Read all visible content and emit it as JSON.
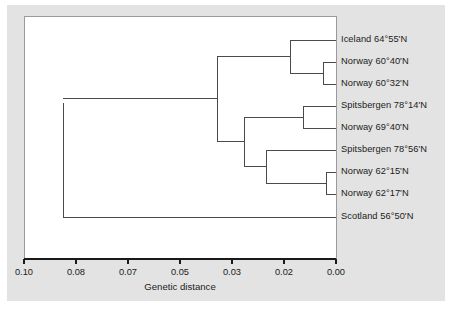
{
  "figure": {
    "background_color": "#ffffff",
    "plate_color": "#e3e3e3",
    "panel_color": "#ffffff",
    "line_color": "#4a4a4a",
    "text_color": "#1b1b1b"
  },
  "chart_data": {
    "type": "dendrogram",
    "title": "",
    "xlabel": "Genetic distance",
    "ylabel": "",
    "xlim": [
      0.1,
      0.0
    ],
    "x_axis_reversed": true,
    "grid": false,
    "legend": "none",
    "tick_labels": [
      "0.10",
      "0.08",
      "0.07",
      "0.05",
      "0.03",
      "0.02",
      "0.00"
    ],
    "tick_values": [
      0.1,
      0.08,
      0.07,
      0.05,
      0.03,
      0.02,
      0.0
    ],
    "tick_positions_px": [
      24,
      76,
      128,
      180,
      232,
      284,
      336
    ],
    "leaves": [
      {
        "label": "Iceland 64°55'N",
        "y_px": 40
      },
      {
        "label": "Norway 60°40'N",
        "y_px": 62
      },
      {
        "label": "Norway 60°32'N",
        "y_px": 84
      },
      {
        "label": "Spitsbergen 78°14'N",
        "y_px": 106
      },
      {
        "label": "Norway 69°40'N",
        "y_px": 128
      },
      {
        "label": "Spitsbergen 78°56'N",
        "y_px": 150
      },
      {
        "label": "Norway 62°15'N",
        "y_px": 172
      },
      {
        "label": "Norway 62°17'N",
        "y_px": 194
      },
      {
        "label": "Scotland 56°50'N",
        "y_px": 217
      }
    ],
    "nodes": [
      {
        "name": "norway-60-pair",
        "x_px": 323,
        "merge_distance": 0.005,
        "y_top_px": 62,
        "y_bot_px": 84
      },
      {
        "name": "iceland-norway60-clade",
        "x_px": 290,
        "merge_distance": 0.019,
        "y_top_px": 40,
        "y_bot_px": 73
      },
      {
        "name": "spitsbergen78-14-norway69-pair",
        "x_px": 303,
        "merge_distance": 0.013,
        "y_top_px": 106,
        "y_bot_px": 128
      },
      {
        "name": "norway-62-pair",
        "x_px": 326,
        "merge_distance": 0.004,
        "y_top_px": 172,
        "y_bot_px": 194
      },
      {
        "name": "spitsbergen78-56-norway62-clade",
        "x_px": 266,
        "merge_distance": 0.027,
        "y_top_px": 150,
        "y_bot_px": 183
      },
      {
        "name": "northern-clade",
        "x_px": 244,
        "merge_distance": 0.035,
        "y_top_px": 117,
        "y_bot_px": 166
      },
      {
        "name": "major-clade",
        "x_px": 217,
        "merge_distance": 0.038,
        "y_top_px": 56,
        "y_bot_px": 141
      },
      {
        "name": "root",
        "x_px": 63,
        "merge_distance": 0.084,
        "y_top_px": 103,
        "y_bot_px": 217
      }
    ]
  },
  "axis": {
    "title": "Genetic distance"
  }
}
